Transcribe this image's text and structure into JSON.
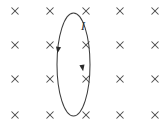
{
  "figure": {
    "width": 163,
    "height": 132,
    "background_color": "#ffffff"
  },
  "field": {
    "symbol": "x",
    "meaning": "magnetic-field-into-page",
    "color": "#4a4a4a",
    "columns_x": [
      15,
      50,
      86,
      120,
      155
    ],
    "rows_y": [
      11,
      45,
      79,
      115
    ],
    "mark_size": 7,
    "count": 20,
    "marks": [
      {
        "x": 15,
        "y": 11
      },
      {
        "x": 50,
        "y": 11
      },
      {
        "x": 86,
        "y": 11
      },
      {
        "x": 120,
        "y": 11
      },
      {
        "x": 155,
        "y": 11
      },
      {
        "x": 15,
        "y": 45
      },
      {
        "x": 50,
        "y": 45
      },
      {
        "x": 86,
        "y": 45
      },
      {
        "x": 120,
        "y": 45
      },
      {
        "x": 155,
        "y": 45
      },
      {
        "x": 15,
        "y": 79
      },
      {
        "x": 50,
        "y": 79
      },
      {
        "x": 86,
        "y": 79
      },
      {
        "x": 120,
        "y": 79
      },
      {
        "x": 155,
        "y": 79
      },
      {
        "x": 15,
        "y": 115
      },
      {
        "x": 50,
        "y": 115
      },
      {
        "x": 86,
        "y": 115
      },
      {
        "x": 120,
        "y": 115
      },
      {
        "x": 155,
        "y": 115
      }
    ]
  },
  "loop": {
    "shape": "ellipse",
    "center_x": 73.5,
    "center_y": 64.5,
    "radius_x": 16.5,
    "radius_y": 51.5,
    "stroke_color": "#3d3d3d",
    "stroke_width": 1.05
  },
  "current": {
    "label": "I",
    "direction": "downward-on-both-visible-sides",
    "color": "#2b2b2b",
    "label_x": 81,
    "label_y": 20,
    "arrows": [
      {
        "x": 58,
        "y": 50,
        "angle": 100
      },
      {
        "x": 82.5,
        "y": 68,
        "angle": 80
      }
    ]
  }
}
